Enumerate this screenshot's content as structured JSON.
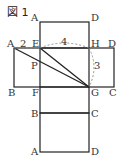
{
  "figure": {
    "title": "図 1",
    "labels": {
      "top_A": "A",
      "top_D": "D",
      "mid_A": "A",
      "E": "E",
      "H": "H",
      "mid_D": "D",
      "P": "P",
      "mid_B": "B",
      "F": "F",
      "G": "G",
      "mid_C": "C",
      "low_B": "B",
      "low_C": "C",
      "bot_A": "A",
      "bot_D": "D"
    },
    "measurements": {
      "AE": "2",
      "EH": "4",
      "HG": "3"
    },
    "colors": {
      "line": "#222222",
      "dashed": "#888888"
    }
  }
}
